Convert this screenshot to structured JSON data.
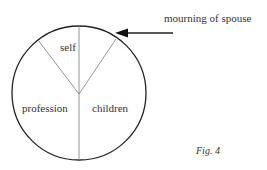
{
  "figure": {
    "caption": "Fig. 4",
    "annotation": "mourning of spouse",
    "segments": [
      {
        "label": "self"
      },
      {
        "label": "profession"
      },
      {
        "label": "children"
      }
    ]
  },
  "colors": {
    "circle": "#222222",
    "dividers": "#888888",
    "arrow": "#222222",
    "text": "#333333"
  }
}
